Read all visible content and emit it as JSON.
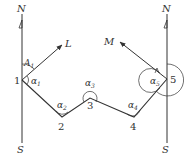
{
  "diagram": {
    "title": "",
    "colors": {
      "line": "#333333",
      "background": "#ffffff"
    },
    "meridians": [
      {
        "id": "left",
        "north_label": "N",
        "south_label": "S",
        "x": 22,
        "y_top": 10,
        "y_bottom": 143
      },
      {
        "id": "right",
        "north_label": "N",
        "south_label": "S",
        "x": 167,
        "y_top": 10,
        "y_bottom": 143
      }
    ],
    "points": [
      {
        "label": "1",
        "x": 22,
        "y": 80
      },
      {
        "label": "2",
        "x": 62,
        "y": 117
      },
      {
        "label": "3",
        "x": 90,
        "y": 98
      },
      {
        "label": "4",
        "x": 134,
        "y": 117
      },
      {
        "label": "5",
        "x": 167,
        "y": 79
      }
    ],
    "directions": [
      {
        "label": "L",
        "from": "1",
        "to_x": 62,
        "to_y": 43
      },
      {
        "label": "M",
        "from": "5",
        "to_x": 118,
        "to_y": 40
      }
    ],
    "angles": [
      {
        "label": "A",
        "sub": "1",
        "at": "1",
        "desc": "azimuth from N to L"
      },
      {
        "label": "α",
        "sub": "1",
        "at": "1"
      },
      {
        "label": "α",
        "sub": "2",
        "at": "2"
      },
      {
        "label": "α",
        "sub": "3",
        "at": "3"
      },
      {
        "label": "α",
        "sub": "4",
        "at": "4"
      },
      {
        "label": "α",
        "sub": "5",
        "at": "5"
      }
    ]
  }
}
